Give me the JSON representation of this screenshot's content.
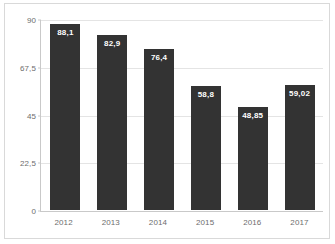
{
  "chart_data": {
    "type": "bar",
    "title": "",
    "subtitle": "",
    "xlabel": "",
    "ylabel": "",
    "categories": [
      "2012",
      "2013",
      "2014",
      "2015",
      "2016",
      "2017"
    ],
    "values": [
      88.1,
      82.9,
      76.4,
      58.8,
      48.85,
      59.02
    ],
    "value_labels": [
      "88,1",
      "82,9",
      "76,4",
      "58,8",
      "48,85",
      "59,02"
    ],
    "ylim": [
      0,
      90
    ],
    "yticks": [
      0,
      22.5,
      45,
      67.5,
      90
    ],
    "ytick_labels": [
      "0",
      "22,5",
      "45",
      "67,5",
      "90"
    ],
    "grid": true,
    "legend": false,
    "legend_position": "none",
    "colors": {
      "bar_fill": "#333333",
      "data_label": "#ffffff",
      "axis_text": "#6d6d6d",
      "gridline": "#e4e4e4",
      "axis_line": "#c9c9c9",
      "frame_border": "#d9d9d9",
      "background": "#ffffff"
    }
  }
}
